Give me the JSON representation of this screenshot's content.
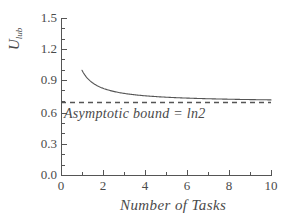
{
  "figure": {
    "background_color": "#ffffff",
    "ink_color": "#555555",
    "text_color": "#4a4a4a"
  },
  "axes": {
    "y_title_main": "U",
    "y_title_sub": "lub",
    "x_title": "Number of Tasks",
    "y_ticks": [
      "0.0",
      "0.3",
      "0.6",
      "0.9",
      "1.2",
      "1.5"
    ],
    "x_ticks": [
      "0",
      "2",
      "4",
      "6",
      "8",
      "10"
    ]
  },
  "annotations": {
    "asymptotic_bound": "Asymptotic bound = ln2"
  },
  "chart_data": {
    "type": "line",
    "title": "",
    "xlabel": "Number of Tasks",
    "ylabel": "U_lub",
    "xlim": [
      0,
      10
    ],
    "ylim": [
      0.0,
      1.5
    ],
    "grid": false,
    "legend": "none",
    "xticks": [
      0,
      2,
      4,
      6,
      8,
      10
    ],
    "yticks": [
      0.0,
      0.3,
      0.6,
      0.9,
      1.2,
      1.5
    ],
    "xminor_step": 0.5,
    "yminor_step": 0.075,
    "series": [
      {
        "name": "U_lub = n(2^(1/n) - 1)",
        "style": "solid",
        "color": "#555555",
        "x": [
          1,
          1.25,
          1.5,
          1.75,
          2,
          2.5,
          3,
          3.5,
          4,
          4.5,
          5,
          5.5,
          6,
          6.5,
          7,
          7.5,
          8,
          8.5,
          9,
          9.5,
          10
        ],
        "y": [
          1.0,
          0.9439,
          0.9032,
          0.8722,
          0.8284,
          0.8059,
          0.7798,
          0.7612,
          0.7568,
          0.747,
          0.7435,
          0.736,
          0.7348,
          0.7294,
          0.7286,
          0.7245,
          0.7241,
          0.7208,
          0.7206,
          0.7179,
          0.7177
        ]
      },
      {
        "name": "Asymptotic bound = ln2",
        "style": "dashed",
        "color": "#555555",
        "x": [
          0,
          10
        ],
        "y": [
          0.6931,
          0.6931
        ]
      }
    ]
  }
}
